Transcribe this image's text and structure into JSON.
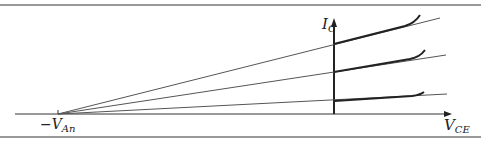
{
  "figure": {
    "type": "Early effect diagram (BJT output characteristics)",
    "y_axis_label": {
      "main": "I",
      "sub": "C"
    },
    "x_axis_label": {
      "main": "V",
      "sub": "CE"
    },
    "intercept_label": {
      "prefix": "−V",
      "sub": "An"
    },
    "curves": [
      {
        "name": "high-base-current",
        "y_at_axis": 44
      },
      {
        "name": "mid-base-current",
        "y_at_axis": 72
      },
      {
        "name": "low-base-current",
        "y_at_axis": 101
      }
    ],
    "colors": {
      "line": "#2a2a2a",
      "extrapolation": "#555555",
      "border": "#777777"
    }
  }
}
